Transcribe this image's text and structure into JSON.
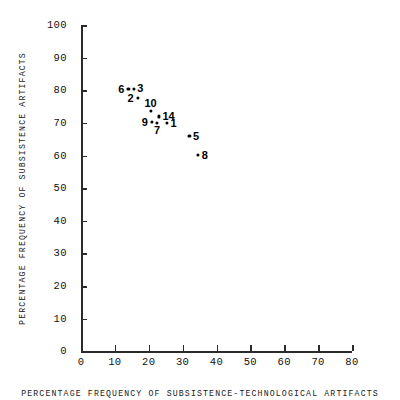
{
  "chart_data": {
    "type": "scatter",
    "title": "",
    "xlabel": "PERCENTAGE FREQUENCY OF SUBSISTENCE-TECHNOLOGICAL ARTIFACTS",
    "ylabel": "PERCENTAGE FREQUENCY OF SUBSISTENCE ARTIFACTS",
    "xlim": [
      0,
      80
    ],
    "ylim": [
      0,
      100
    ],
    "xticks": [
      0,
      10,
      20,
      30,
      40,
      50,
      60,
      70,
      80
    ],
    "yticks": [
      0,
      10,
      20,
      30,
      40,
      50,
      60,
      70,
      80,
      90,
      100
    ],
    "xtick_labels": [
      "0",
      "10",
      "20",
      "30",
      "40",
      "50",
      "60",
      "70",
      "80"
    ],
    "ytick_labels": [
      "0",
      "10",
      "20",
      "30",
      "40",
      "50",
      "60",
      "70",
      "80",
      "90",
      "100"
    ],
    "grid": false,
    "legend": false,
    "marker_color": "#000000",
    "axis_color": "#2b2b2b",
    "points": [
      {
        "label": "6",
        "x": 14.0,
        "y": 80.3,
        "label_pos": "left"
      },
      {
        "label": "3",
        "x": 15.6,
        "y": 80.5,
        "label_pos": "right"
      },
      {
        "label": "2",
        "x": 16.8,
        "y": 77.6,
        "label_pos": "left"
      },
      {
        "label": "10",
        "x": 20.6,
        "y": 73.6,
        "label_pos": "above"
      },
      {
        "label": "14",
        "x": 23.0,
        "y": 72.0,
        "label_pos": "right"
      },
      {
        "label": "9",
        "x": 21.0,
        "y": 70.2,
        "label_pos": "left"
      },
      {
        "label": "7",
        "x": 22.5,
        "y": 69.9,
        "label_pos": "below"
      },
      {
        "label": "1",
        "x": 25.4,
        "y": 69.9,
        "label_pos": "right"
      },
      {
        "label": "5",
        "x": 32.0,
        "y": 65.9,
        "label_pos": "right"
      },
      {
        "label": "8",
        "x": 34.6,
        "y": 60.1,
        "label_pos": "right"
      }
    ]
  }
}
